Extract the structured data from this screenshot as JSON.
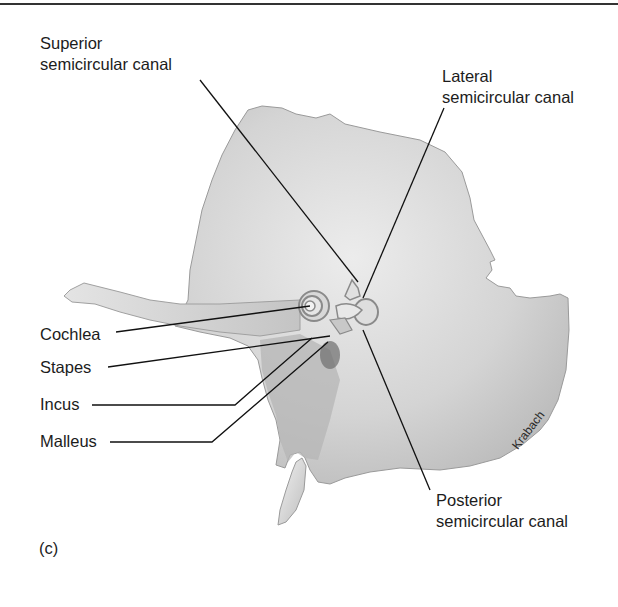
{
  "figure": {
    "panel_label": "(c)",
    "signature": "Krabach",
    "labels": {
      "superior": {
        "line1": "Superior",
        "line2": "semicircular canal"
      },
      "lateral": {
        "line1": "Lateral",
        "line2": "semicircular canal"
      },
      "cochlea": "Cochlea",
      "stapes": "Stapes",
      "incus": "Incus",
      "malleus": "Malleus",
      "posterior": {
        "line1": "Posterior",
        "line2": "semicircular canal"
      }
    },
    "colors": {
      "bone_fill": "#d6d6d6",
      "bone_shadow": "#a9a9a9",
      "leader_line": "#111111",
      "text": "#1c1c1c"
    }
  }
}
